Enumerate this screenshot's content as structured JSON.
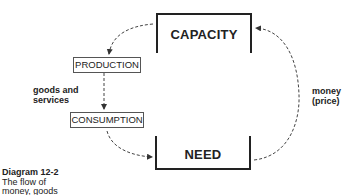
{
  "diagram": {
    "nodes": {
      "capacity": "CAPACITY",
      "need": "NEED",
      "production": "PRODUCTION",
      "consumption": "CONSUMPTION"
    },
    "edge_labels": {
      "goods_line1": "goods and",
      "goods_line2": "services",
      "money_line1": "money",
      "money_line2": "(price)"
    },
    "edges": [
      {
        "from": "CAPACITY",
        "to": "PRODUCTION",
        "style": "dashed"
      },
      {
        "from": "PRODUCTION",
        "to": "CONSUMPTION",
        "style": "dashed",
        "label": "goods and services"
      },
      {
        "from": "CONSUMPTION",
        "to": "NEED",
        "style": "dashed"
      },
      {
        "from": "NEED",
        "to": "CAPACITY",
        "style": "dashed",
        "label": "money (price)"
      }
    ],
    "caption": {
      "title": "Diagram 12-2",
      "line1": "The flow of",
      "line2": "money, goods"
    },
    "colors": {
      "line": "#222222",
      "dashed": "#444444",
      "box_border": "#555555"
    }
  }
}
